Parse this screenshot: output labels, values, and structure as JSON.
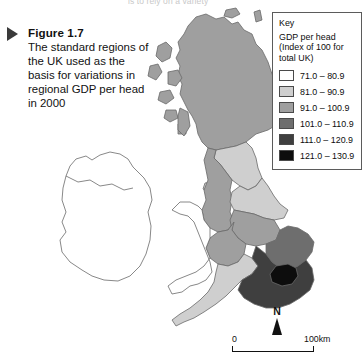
{
  "page": {
    "top_cut_text": "is to rely on a variety"
  },
  "caption": {
    "bullet_icon": "triangle-right-icon",
    "figure_number": "Figure 1.7",
    "text": "The standard regions of the UK used as the basis for variations in regional GDP per head in 2000"
  },
  "legend": {
    "title": "Key",
    "subtitle_line1": "GDP per head",
    "subtitle_line2": "(Index of 100 for",
    "subtitle_line3": "total UK)",
    "entries": [
      {
        "label": "71.0 – 80.9",
        "color": "#ffffff"
      },
      {
        "label": "81.0 – 90.9",
        "color": "#cfcfcf"
      },
      {
        "label": "91.0 – 100.9",
        "color": "#9f9f9f"
      },
      {
        "label": "101.0 – 110.9",
        "color": "#6e6e6e"
      },
      {
        "label": "111.0 – 120.9",
        "color": "#3f3f3f"
      },
      {
        "label": "121.0 – 130.9",
        "color": "#0d0d0d"
      }
    ]
  },
  "north_arrow": {
    "label": "N",
    "icon": "north-arrow-icon"
  },
  "scale_bar": {
    "start_label": "0",
    "end_label": "100km"
  },
  "map": {
    "title": "standard regions of the UK shaded by GDP per head index",
    "regions": [
      {
        "name": "Scotland",
        "class_index": 2,
        "color": "#9f9f9f"
      },
      {
        "name": "North East England",
        "class_index": 1,
        "color": "#cfcfcf"
      },
      {
        "name": "North West England",
        "class_index": 2,
        "color": "#9f9f9f"
      },
      {
        "name": "Yorkshire and the Humber",
        "class_index": 1,
        "color": "#cfcfcf"
      },
      {
        "name": "East Midlands",
        "class_index": 2,
        "color": "#9f9f9f"
      },
      {
        "name": "West Midlands",
        "class_index": 2,
        "color": "#9f9f9f"
      },
      {
        "name": "Wales",
        "class_index": 0,
        "color": "#ffffff"
      },
      {
        "name": "East of England",
        "class_index": 3,
        "color": "#6e6e6e"
      },
      {
        "name": "South West England",
        "class_index": 1,
        "color": "#cfcfcf"
      },
      {
        "name": "South East England",
        "class_index": 4,
        "color": "#3f3f3f"
      },
      {
        "name": "London",
        "class_index": 5,
        "color": "#0d0d0d"
      },
      {
        "name": "Ireland",
        "class_index": -1,
        "color": "#ffffff"
      }
    ]
  }
}
